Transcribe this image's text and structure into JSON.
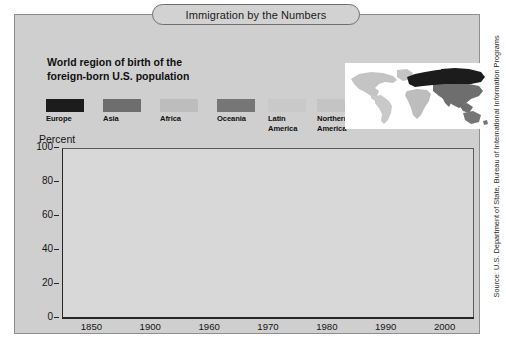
{
  "header": {
    "title": "Immigration by the Numbers"
  },
  "subtitle": {
    "line1": "World region of birth of the",
    "line2": "foreign-born U.S. population"
  },
  "source": {
    "text": "Source: U.S. Department of State, Bureau of International Information Programs"
  },
  "legend": {
    "items": [
      {
        "label": "Europe",
        "label2": "",
        "color": "#1c1c1c"
      },
      {
        "label": "Asia",
        "label2": "",
        "color": "#6e6e6e"
      },
      {
        "label": "Africa",
        "label2": "",
        "color": "#bdbdbd"
      },
      {
        "label": "Oceania",
        "label2": "",
        "color": "#767676"
      },
      {
        "label": "Latin",
        "label2": "America",
        "color": "#c9c9c9"
      },
      {
        "label": "Northern",
        "label2": "America",
        "color": "#c4c4c4"
      }
    ]
  },
  "map": {
    "name": "world-map",
    "background": "#ffffff",
    "regions": [
      {
        "name": "europe",
        "color": "#1c1c1c"
      },
      {
        "name": "asia",
        "color": "#6e6e6e"
      },
      {
        "name": "africa",
        "color": "#bdbdbd"
      },
      {
        "name": "oceania",
        "color": "#767676"
      },
      {
        "name": "latin-america",
        "color": "#c9c9c9"
      },
      {
        "name": "northern-america",
        "color": "#c4c4c4"
      }
    ]
  },
  "chart_data": {
    "type": "bar",
    "subtype": "stacked-column-100",
    "title": "Immigration by the Numbers",
    "subtitle": "World region of birth of the foreign-born U.S. population",
    "xlabel": "",
    "ylabel": "Percent",
    "ylim": [
      0,
      100
    ],
    "yticks": [
      0,
      20,
      40,
      60,
      80,
      100
    ],
    "grid": false,
    "legend_position": "top",
    "plot_background": "#d8d8d8",
    "categories": [
      "1850",
      "1900",
      "1960",
      "1970",
      "1980",
      "1990",
      "2000"
    ],
    "series": [
      {
        "name": "Europe",
        "color": "#1c1c1c",
        "values": [
          92.5,
          86.0,
          75.0,
          61.5,
          39.0,
          22.5,
          15.5
        ]
      },
      {
        "name": "Asia",
        "color": "#6e6e6e",
        "values": [
          0.5,
          1.0,
          5.0,
          8.5,
          18.0,
          26.5,
          26.0
        ]
      },
      {
        "name": "Latin America",
        "color": "#c9c9c9",
        "values": [
          5.0,
          11.0,
          18.0,
          28.0,
          41.0,
          49.0,
          56.0
        ]
      },
      {
        "name": "Africa",
        "color": "#bdbdbd",
        "values": [
          0.5,
          0.5,
          0.5,
          0.8,
          1.0,
          1.2,
          1.5
        ]
      },
      {
        "name": "Northern America",
        "color": "#c4c4c4",
        "values": [
          1.3,
          1.3,
          1.3,
          1.0,
          0.8,
          0.6,
          0.6
        ]
      },
      {
        "name": "Oceania",
        "color": "#767676",
        "values": [
          0.2,
          0.2,
          0.2,
          0.2,
          0.2,
          0.2,
          0.4
        ]
      }
    ],
    "bars": [
      {
        "year": "1850",
        "segments": [
          {
            "region": "Europe",
            "value": 92.5,
            "color": "#1c1c1c"
          },
          {
            "region": "Asia",
            "value": 0.5,
            "color": "#6e6e6e"
          },
          {
            "region": "Latin America",
            "value": 5.0,
            "color": "#c9c9c9"
          },
          {
            "region": "Northern America",
            "value": 2.0,
            "color": "#c4c4c4"
          }
        ]
      },
      {
        "year": "1900",
        "segments": [
          {
            "region": "Europe",
            "value": 86.0,
            "color": "#1c1c1c"
          },
          {
            "region": "Asia",
            "value": 1.0,
            "color": "#6e6e6e"
          },
          {
            "region": "Latin America",
            "value": 11.0,
            "color": "#c9c9c9"
          },
          {
            "region": "Northern America",
            "value": 2.0,
            "color": "#c4c4c4"
          }
        ]
      },
      {
        "year": "1960",
        "segments": [
          {
            "region": "Europe",
            "value": 75.0,
            "color": "#1c1c1c"
          },
          {
            "region": "Asia",
            "value": 5.0,
            "color": "#6e6e6e"
          },
          {
            "region": "Latin America",
            "value": 18.5,
            "color": "#c9c9c9"
          },
          {
            "region": "Northern America",
            "value": 1.5,
            "color": "#c4c4c4"
          }
        ]
      },
      {
        "year": "1970",
        "segments": [
          {
            "region": "Europe",
            "value": 61.5,
            "color": "#1c1c1c"
          },
          {
            "region": "Asia",
            "value": 8.5,
            "color": "#6e6e6e"
          },
          {
            "region": "Africa",
            "value": 1.5,
            "color": "#bdbdbd"
          },
          {
            "region": "Latin America",
            "value": 27.5,
            "color": "#c9c9c9"
          },
          {
            "region": "Northern America",
            "value": 1.0,
            "color": "#c4c4c4"
          }
        ]
      },
      {
        "year": "1980",
        "segments": [
          {
            "region": "Europe",
            "value": 39.0,
            "color": "#1c1c1c"
          },
          {
            "region": "Asia",
            "value": 18.0,
            "color": "#6e6e6e"
          },
          {
            "region": "Africa",
            "value": 1.5,
            "color": "#bdbdbd"
          },
          {
            "region": "Latin America",
            "value": 40.5,
            "color": "#c9c9c9"
          },
          {
            "region": "Northern America",
            "value": 1.0,
            "color": "#c4c4c4"
          }
        ]
      },
      {
        "year": "1990",
        "segments": [
          {
            "region": "Europe",
            "value": 22.5,
            "color": "#1c1c1c"
          },
          {
            "region": "Asia",
            "value": 26.5,
            "color": "#6e6e6e"
          },
          {
            "region": "Africa",
            "value": 1.8,
            "color": "#bdbdbd"
          },
          {
            "region": "Latin America",
            "value": 48.2,
            "color": "#c9c9c9"
          },
          {
            "region": "Northern America",
            "value": 1.0,
            "color": "#c4c4c4"
          }
        ]
      },
      {
        "year": "2000",
        "segments": [
          {
            "region": "Europe",
            "value": 15.5,
            "color": "#1c1c1c"
          },
          {
            "region": "Asia",
            "value": 26.0,
            "color": "#6e6e6e"
          },
          {
            "region": "Africa",
            "value": 2.0,
            "color": "#bdbdbd"
          },
          {
            "region": "Latin America",
            "value": 55.5,
            "color": "#c9c9c9"
          },
          {
            "region": "Northern America",
            "value": 1.0,
            "color": "#c4c4c4"
          }
        ]
      }
    ]
  }
}
